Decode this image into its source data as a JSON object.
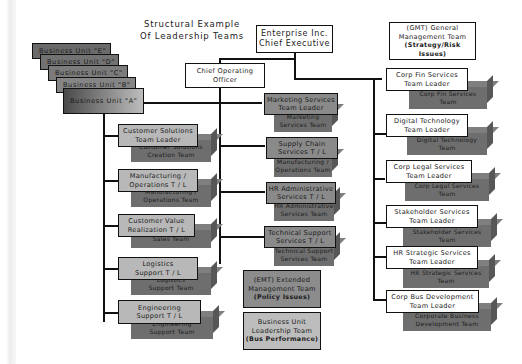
{
  "title": {
    "line1": "Structural Example",
    "line2": "Of Leadership Teams"
  },
  "ceo": {
    "line1": "Enterprise Inc.",
    "line2": "Chief Executive"
  },
  "coo": {
    "line1": "Chief Operating",
    "line2": "Officer"
  },
  "gmt": {
    "line1": "(GMT) General",
    "line2": "Management Team",
    "line3": "(Strategy/Risk Issues)"
  },
  "business_units": [
    "Business Unit \"E\"",
    "Business Unit \"D\"",
    "Business Unit \"C\"",
    "Business Unit \"B\"",
    "Business Unit \"A\""
  ],
  "left_column": [
    {
      "leader1": "Customer Solutions",
      "leader2": "Team Leader",
      "team1": "Customer Solutions",
      "team2": "Creation Team"
    },
    {
      "leader1": "Manufacturing /",
      "leader2": "Operations T / L",
      "team1": "Manufacturing /",
      "team2": "Operations Team"
    },
    {
      "leader1": "Customer Value",
      "leader2": "Realization T / L",
      "team1": "Sales Team",
      "team2": ""
    },
    {
      "leader1": "Logistics",
      "leader2": "Support T / L",
      "team1": "Logistics",
      "team2": "Support Team"
    },
    {
      "leader1": "Engineering",
      "leader2": "Support T / L",
      "team1": "Engineering",
      "team2": "Support Team"
    }
  ],
  "middle_column": [
    {
      "leader1": "Marketing Services",
      "leader2": "Team Leader",
      "team1": "Marketing",
      "team2": "Services Team"
    },
    {
      "leader1": "Supply Chain",
      "leader2": "Services T / L",
      "team1": "Manufacturing /",
      "team2": "Operations Team"
    },
    {
      "leader1": "HR Administrative",
      "leader2": "Services T / L",
      "team1": "HR Administrative",
      "team2": "Services Team"
    },
    {
      "leader1": "Technical Support",
      "leader2": "Services T / L",
      "team1": "Technical Support",
      "team2": "Services Team"
    }
  ],
  "emt": {
    "line1": "(EMT) Extended",
    "line2": "Management Team",
    "line3": "(Policy Issues)"
  },
  "bult": {
    "line1": "Business Unit",
    "line2": "Leadership Team",
    "line3": "(Bus Performance)"
  },
  "right_column": [
    {
      "leader1": "Corp Fin Services",
      "leader2": "Team Leader",
      "team1": "Corp Fin Services",
      "team2": "Team"
    },
    {
      "leader1": "Digital Technology",
      "leader2": "Team Leader",
      "team1": "Digital Technology",
      "team2": "Team"
    },
    {
      "leader1": "Corp Legal Services",
      "leader2": "Team Leader",
      "team1": "Corp Legal Services",
      "team2": "Team"
    },
    {
      "leader1": "Stakeholder Services",
      "leader2": "Team Leader",
      "team1": "Stakeholder Services",
      "team2": "Team"
    },
    {
      "leader1": "HR Strategic Services",
      "leader2": "Team Leader",
      "team1": "HR Strategic Services",
      "team2": "Team"
    },
    {
      "leader1": "Corp Bus Development",
      "leader2": "Team Leader",
      "team1": "Corporate Business",
      "team2": "Development Team"
    }
  ]
}
